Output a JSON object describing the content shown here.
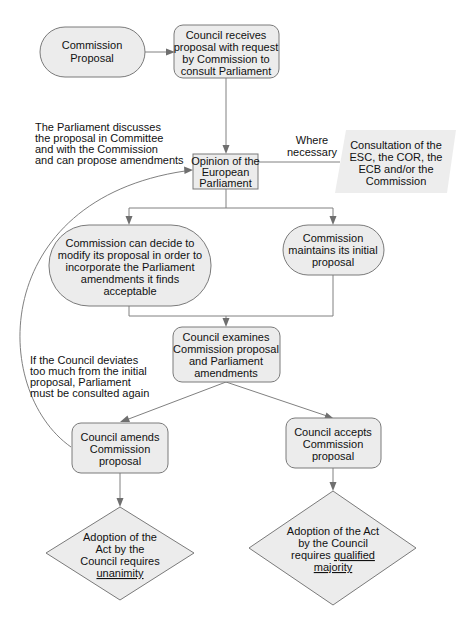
{
  "diagram": {
    "nodes": {
      "commission_proposal": {
        "lines": [
          "Commission",
          "Proposal"
        ]
      },
      "council_receives": {
        "lines": [
          "Council receives",
          "proposal with request",
          "by Commission to",
          "consult Parliament"
        ]
      },
      "opinion_ep": {
        "lines": [
          "Opinion of the",
          "European",
          "Parliament"
        ]
      },
      "consultation": {
        "lines": [
          "Consultation of the",
          "ESC, the COR, the",
          "ECB and/or the",
          "Commission"
        ]
      },
      "commission_modify": {
        "lines": [
          "Commission can decide to",
          "modify its proposal in order to",
          "incorporate the Parliament",
          "amendments it finds",
          "acceptable"
        ]
      },
      "commission_maintains": {
        "lines": [
          "Commission",
          "maintains its initial",
          "proposal"
        ]
      },
      "council_examines": {
        "lines": [
          "Council examines",
          "Commission proposal",
          "and Parliament",
          "amendments"
        ]
      },
      "council_amends": {
        "lines": [
          "Council amends",
          "Commission",
          "proposal"
        ]
      },
      "council_accepts": {
        "lines": [
          "Council accepts",
          "Commission",
          "proposal"
        ]
      },
      "adoption_unanimity": {
        "lines": [
          "Adoption of the",
          "Act by the",
          "Council requires"
        ],
        "emphasis": "unanimity"
      },
      "adoption_qmv": {
        "lines": [
          "Adoption of the Act",
          "by the Council"
        ],
        "prefix": "requires ",
        "emphasis_1": "qualified",
        "emphasis_2": "majority"
      }
    },
    "annotations": {
      "parliament_discusses": [
        "The Parliament discusses",
        "the proposal in Committee",
        "and with the Commission",
        "and can propose amendments"
      ],
      "where_necessary": [
        "Where",
        "necessary"
      ],
      "council_deviates": [
        "If the Council deviates",
        "too much from the initial",
        "proposal, Parliament",
        "must be consulted again"
      ]
    }
  }
}
